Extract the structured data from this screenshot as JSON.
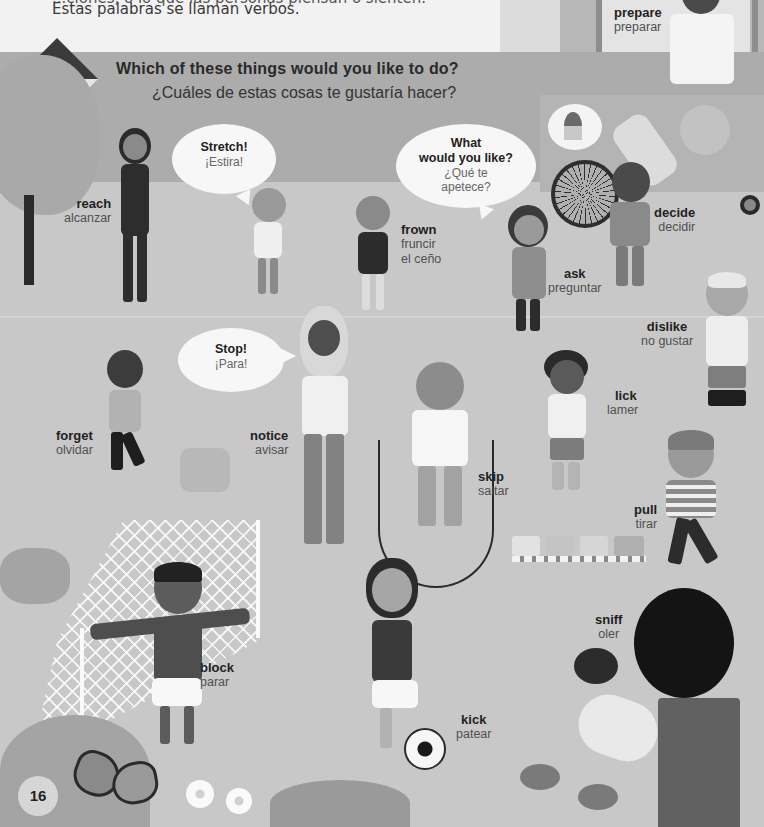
{
  "page": {
    "number": "16",
    "intro": {
      "line1_clipped": "...ciones, o lo que las personas piensan o sienten.",
      "line2": "Estas palabras se llaman verbos."
    },
    "question": {
      "en": "Which of these things would you like to do?",
      "es": "¿Cuáles de estas cosas te gustaría hacer?"
    }
  },
  "speech_bubbles": [
    {
      "id": "stretch",
      "en": "Stretch!",
      "es": "¡Estira!"
    },
    {
      "id": "what",
      "en": "What would you like?",
      "en_line1": "What",
      "en_line2": "would you like?",
      "es_line1": "¿Qué te",
      "es_line2": "apetece?"
    },
    {
      "id": "stop",
      "en": "Stop!",
      "es": "¡Para!"
    }
  ],
  "verbs": [
    {
      "en": "prepare",
      "es": "preparar"
    },
    {
      "en": "reach",
      "es": "alcanzar"
    },
    {
      "en": "frown",
      "es_line1": "fruncir",
      "es_line2": "el ceño"
    },
    {
      "en": "ask",
      "es": "preguntar"
    },
    {
      "en": "decide",
      "es": "decidir"
    },
    {
      "en": "dislike",
      "es": "no gustar"
    },
    {
      "en": "forget",
      "es": "olvidar"
    },
    {
      "en": "notice",
      "es": "avisar"
    },
    {
      "en": "lick",
      "es": "lamer"
    },
    {
      "en": "skip",
      "es": "saltar"
    },
    {
      "en": "pull",
      "es": "tirar"
    },
    {
      "en": "block",
      "es": "parar"
    },
    {
      "en": "sniff",
      "es": "oler"
    },
    {
      "en": "kick",
      "es": "patear"
    }
  ],
  "colors": {
    "background": "#c8c8c8",
    "band": "#acacac",
    "top": "#f2f2f2",
    "text_dark": "#222222",
    "text_light": "#505050"
  }
}
